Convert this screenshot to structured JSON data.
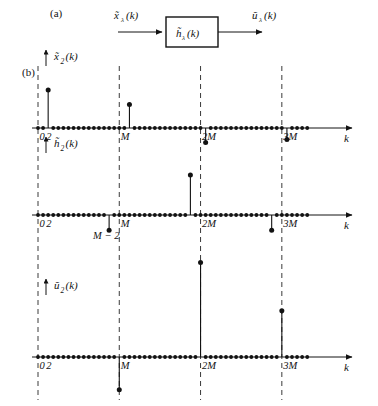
{
  "figure": {
    "panels": [
      {
        "tag": "(a)",
        "type": "block-diagram"
      },
      {
        "tag": "(b)",
        "type": "stem-plots"
      }
    ]
  },
  "block_diagram": {
    "input_label": "x̃",
    "input_sub": "λ",
    "input_arg": "(k)",
    "block_label": "h̃",
    "block_sub": "λ",
    "block_arg": "(k)",
    "output_label": "ũ",
    "output_sub": "λ",
    "output_arg": "(k)"
  },
  "axis": {
    "xlabel": "k",
    "tick_labels": [
      "0",
      "2",
      "M",
      "2M",
      "3M"
    ],
    "grid_labels": [
      "0",
      "M",
      "2M",
      "3M"
    ],
    "extra_label": "M − 2"
  },
  "chart_data": {
    "type": "line",
    "title": "",
    "xlabel": "k",
    "ylabel": "",
    "grid": true,
    "axis_ticks": [
      0,
      2,
      16,
      32,
      48
    ],
    "axis_tick_labels": [
      "0",
      "2",
      "M",
      "2M",
      "3M"
    ],
    "xlim": [
      -1,
      58
    ],
    "panels": [
      {
        "name": "x2",
        "label": "x̃",
        "label_sub": "2",
        "label_arg": "(k)",
        "ylim": [
          -0.45,
          1.1
        ],
        "baseline_k": [
          0,
          1,
          2,
          3,
          4,
          5,
          6,
          7,
          8,
          9,
          10,
          11,
          12,
          13,
          14,
          15,
          16,
          17,
          18,
          19,
          20,
          21,
          22,
          23,
          24,
          25,
          26,
          27,
          28,
          29,
          30,
          31,
          32,
          33,
          34,
          35,
          36,
          37,
          38,
          39,
          40,
          41,
          42,
          43,
          44,
          45,
          46,
          47,
          48,
          49,
          50,
          51,
          52,
          53
        ],
        "stems": [
          {
            "k": 2,
            "value": 1.0
          },
          {
            "k": 18,
            "value": 0.62
          },
          {
            "k": 33,
            "value": -0.38
          },
          {
            "k": 49,
            "value": -0.3
          }
        ]
      },
      {
        "name": "h2",
        "label": "h̃",
        "label_sub": "2",
        "label_arg": "(k)",
        "ylim": [
          -0.45,
          1.1
        ],
        "baseline_k": [
          0,
          1,
          2,
          3,
          4,
          5,
          6,
          7,
          8,
          9,
          10,
          11,
          12,
          13,
          14,
          15,
          16,
          17,
          18,
          19,
          20,
          21,
          22,
          23,
          24,
          25,
          26,
          27,
          28,
          29,
          30,
          31,
          32,
          33,
          34,
          35,
          36,
          37,
          38,
          39,
          40,
          41,
          42,
          43,
          44,
          45,
          46,
          47,
          48,
          49,
          50,
          51,
          52,
          53
        ],
        "stems": [
          {
            "k": 14,
            "value": -0.38
          },
          {
            "k": 30,
            "value": 1.0
          },
          {
            "k": 46,
            "value": -0.38
          }
        ]
      },
      {
        "name": "u2",
        "label": "ũ",
        "label_sub": "2",
        "label_arg": "(k)",
        "ylim": [
          -0.85,
          2.35
        ],
        "baseline_k": [
          0,
          1,
          2,
          3,
          4,
          5,
          6,
          7,
          8,
          9,
          10,
          11,
          12,
          13,
          14,
          15,
          16,
          17,
          18,
          19,
          20,
          21,
          22,
          23,
          24,
          25,
          26,
          27,
          28,
          29,
          30,
          31,
          32,
          33,
          34,
          35,
          36,
          37,
          38,
          39,
          40,
          41,
          42,
          43,
          44,
          45,
          46,
          47,
          48,
          49,
          50,
          51,
          52,
          53
        ],
        "stems": [
          {
            "k": 16,
            "value": -0.78
          },
          {
            "k": 32,
            "value": 2.25
          },
          {
            "k": 48,
            "value": 1.1
          }
        ]
      }
    ]
  },
  "colors": {
    "ink": "#121212",
    "grid": "#3a3a3a",
    "background": "#ffffff"
  }
}
